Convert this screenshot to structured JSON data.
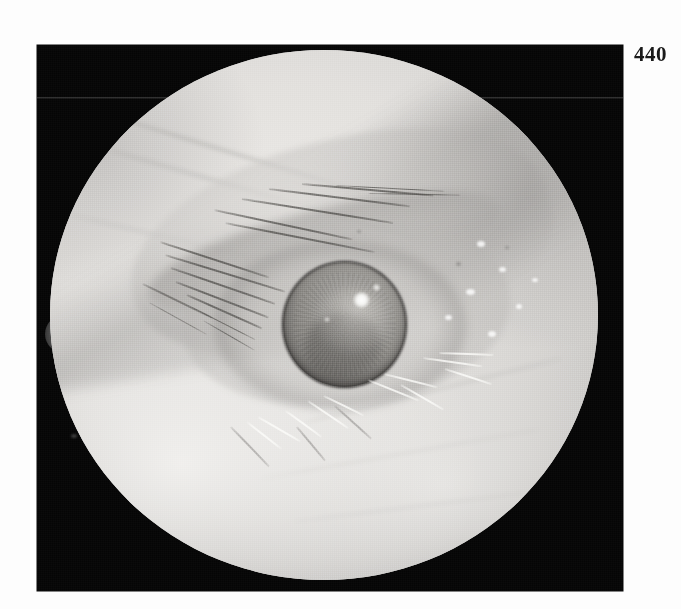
{
  "page": {
    "folio": "440",
    "background_color": "#fdfdfd"
  },
  "plate": {
    "name": "clinical-eye-photograph",
    "frame_color": "#050505",
    "subject": "external eye photograph",
    "modality": "slit-lamp / external ocular photograph",
    "finding": "hazy opacified cornea with central lens opacity and specular light reflex",
    "orientation": "right eye, frontal view",
    "circular_field": true,
    "field_color_light": "#eceae7",
    "field_color_mid": "#bfbdba",
    "field_color_dark": "#8b8a89",
    "highlight_color": "#ffffff",
    "iris_color": "#8a8884",
    "limbus_color": "#2e2c2b"
  },
  "features": {
    "upper_lid": "upper eyelid with dark lashes sweeping down and to the right",
    "lower_lid": "lower eyelid with pale light-reflecting lashes",
    "globe": "cornea and iris disc with bright specular highlight at upper right",
    "notch": "small rounded tab at left margin of the circular field",
    "seam": "faint horizontal scan seam across the upper dark field"
  }
}
